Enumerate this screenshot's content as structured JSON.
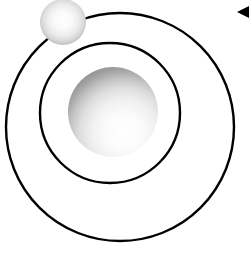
{
  "figure": {
    "background_color": "#ffffff",
    "width": 249,
    "height": 255
  },
  "colors": {
    "background": "#ffffff",
    "orbit_stroke": "#000000",
    "sphere_highlight": "#ffffff",
    "nucleus_shadow": "#9a9a9a",
    "electron_shadow": "#9d9d9d",
    "arrow_fill": "#000000"
  },
  "shapes": {
    "outer_orbit": {
      "name": "outer orbit",
      "cx": 120,
      "cy": 127,
      "r": 114,
      "stroke_width": 2.4
    },
    "inner_orbit": {
      "name": "inner orbit",
      "cx": 110,
      "cy": 113,
      "r": 70,
      "stroke_width": 2.4
    },
    "nucleus": {
      "name": "nucleus",
      "cx": 113,
      "cy": 112,
      "r": 45,
      "highlight_x": "62%",
      "highlight_y": "72%"
    },
    "electron": {
      "name": "electron",
      "cx": 63,
      "cy": 22,
      "r": 23,
      "highlight_x": "50%",
      "highlight_y": "46%"
    },
    "cursor_arrow": {
      "name": "left pointing triangle cursor",
      "points": "249,6 237,12 249,18",
      "x": 237,
      "y": 6,
      "width": 12,
      "height": 12
    }
  },
  "labels": {
    "nucleus": "Nucleus",
    "electron": "Electron",
    "outer_orbit": "Outer orbit",
    "inner_orbit": "Inner orbit",
    "cursor": "Cursor"
  }
}
